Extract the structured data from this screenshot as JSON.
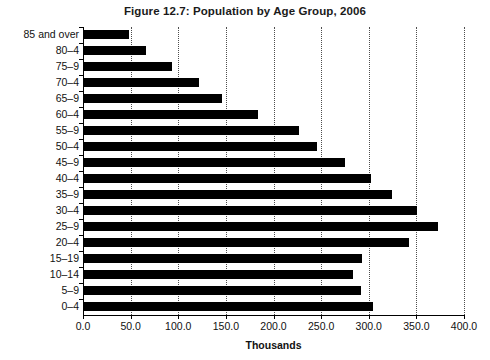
{
  "chart_data": {
    "type": "bar",
    "orientation": "horizontal",
    "title": "Figure 12.7: Population by Age Group, 2006",
    "xlabel": "Thousands",
    "ylabel": "",
    "xlim": [
      0,
      400
    ],
    "xticks": [
      "0.0",
      "50.0",
      "100.0",
      "150.0",
      "200.0",
      "250.0",
      "300.0",
      "350.0",
      "400.0"
    ],
    "xtick_values": [
      0,
      50,
      100,
      150,
      200,
      250,
      300,
      350,
      400
    ],
    "grid": "vertical dotted",
    "legend": "none",
    "bar_color": "#000000",
    "categories": [
      "85 and over",
      "80–4",
      "75–9",
      "70–4",
      "65–9",
      "60–4",
      "55–9",
      "50–4",
      "45–9",
      "40–4",
      "35–9",
      "30–4",
      "25–9",
      "20–4",
      "15–19",
      "10–14",
      "5–9",
      "0–4"
    ],
    "values": [
      48,
      66,
      93,
      122,
      146,
      184,
      227,
      246,
      275,
      302,
      324,
      351,
      373,
      342,
      293,
      283,
      292,
      304
    ]
  }
}
